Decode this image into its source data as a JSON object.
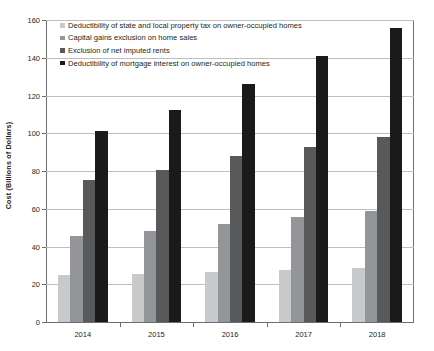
{
  "chart_data": {
    "type": "bar",
    "title": "",
    "subtitle": "",
    "xlabel": "",
    "ylabel": "Cost (Billions of Dollars)",
    "categories": [
      "2014",
      "2015",
      "2016",
      "2017",
      "2018"
    ],
    "ylim": [
      0,
      160
    ],
    "ytick_labels": [
      "0",
      "20",
      "40",
      "60",
      "80",
      "100",
      "120",
      "140",
      "160"
    ],
    "ytick_values": [
      0,
      20,
      40,
      60,
      80,
      100,
      120,
      140,
      160
    ],
    "grid": true,
    "legend_position": "top-left-inside",
    "series": [
      {
        "name": "Deductibility of state and local property tax on owner-occupied homes",
        "color": "#c8c9ca",
        "values": [
          25,
          25.5,
          26.5,
          27.5,
          28.5
        ]
      },
      {
        "name": "Capital gains exclusion on home sales",
        "color": "#939598",
        "values": [
          45.5,
          48,
          52,
          55.5,
          59
        ]
      },
      {
        "name": "Exclusion of net imputed rents",
        "color": "#58595b",
        "values": [
          75,
          80.5,
          88,
          92.5,
          98
        ]
      },
      {
        "name": "Deductibility of mortgage interest on owner-occupied homes",
        "color": "#1a1a1a",
        "values": [
          101,
          112.5,
          126,
          141,
          156
        ]
      }
    ]
  },
  "axes": {
    "y_title": "Cost (Billions of Dollars)"
  }
}
